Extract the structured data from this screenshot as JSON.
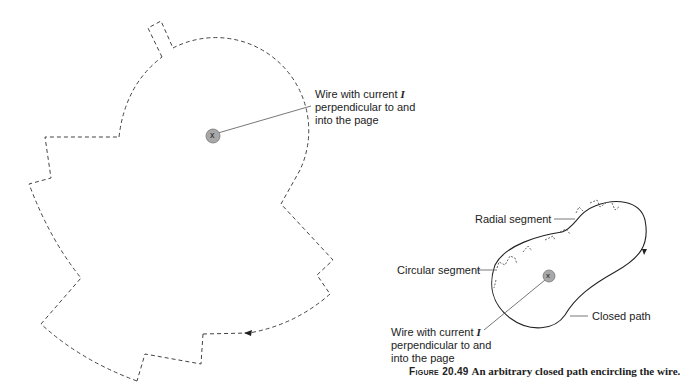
{
  "figure": {
    "number_label": "Figure 20.49",
    "caption": "An arbitrary closed path encircling the wire."
  },
  "left_panel": {
    "wire_label_line1_prefix": "Wire with current ",
    "wire_label_current_symbol": "I",
    "wire_label_line2": "perpendicular to and",
    "wire_label_line3": "into the page",
    "wire_symbol": "x"
  },
  "right_panel": {
    "radial_segment_label": "Radial segment",
    "circular_segment_label": "Circular segment",
    "closed_path_label": "Closed path",
    "wire_label_line1_prefix": "Wire with current ",
    "wire_label_current_symbol": "I",
    "wire_label_line2": "perpendicular to and",
    "wire_label_line3": "into the page",
    "wire_symbol": "x"
  },
  "colors": {
    "path_stroke": "#333333",
    "dashed_stroke": "#444444",
    "wire_fill": "#a8a8a8",
    "wire_stroke": "#777777",
    "leader_line": "#555555",
    "text": "#222222"
  }
}
